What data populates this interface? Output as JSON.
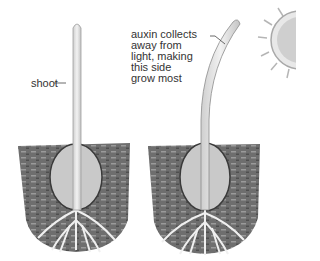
{
  "diagram": {
    "title": "",
    "labels": {
      "shoot": "shoot",
      "auxin_lines": [
        "auxin collects",
        "away from",
        "light, making",
        "this side",
        "grow most"
      ]
    },
    "panels": [
      {
        "name": "seedling-straight",
        "description": "Upright seedling shoot growing from seed in soil"
      },
      {
        "name": "seedling-bending",
        "description": "Seedling shoot bending toward sun"
      }
    ],
    "icons": [
      "sun-icon"
    ],
    "colors": {
      "soil": "#6b6b6b",
      "seed": "#bdbdbd",
      "shoot": "#e0e0e0",
      "text": "#333333",
      "sun": "#cfcfcf"
    }
  }
}
